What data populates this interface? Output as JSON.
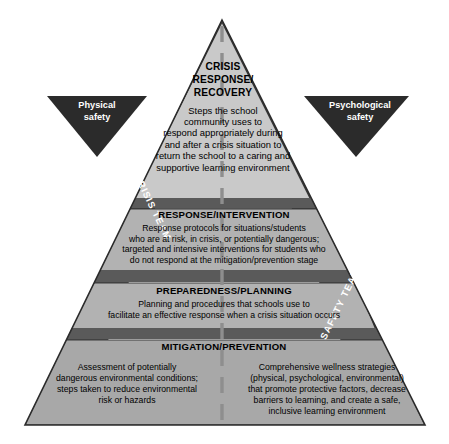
{
  "diagram": {
    "type": "pyramid",
    "colors": {
      "tier_face": "#a8a8a8",
      "tier_face_light": "#c9c9c9",
      "tier_divider": "#5a5a5a",
      "left_shadow_face": "#4a4a4a",
      "right_shadow_face": "#4a4a4a",
      "flag_fill": "#2b2b2b",
      "center_dash": "#8e8e8e",
      "outline": "#2b2b2b",
      "text": "#000000",
      "label_text": "#ffffff"
    },
    "center_divider": "dashed-vertical-line"
  },
  "tiers": [
    {
      "id": "crisis-response-recovery",
      "level": 1,
      "title": "CRISIS\nRESPONSE/\nRECOVERY",
      "title_lines": [
        "CRISIS",
        "RESPONSE/",
        "RECOVERY"
      ],
      "body": "Steps the school community uses to respond appropriately during and after a crisis situation to return the school to a caring and supportive learning environment",
      "body_lines": [
        "Steps the school",
        "community uses to",
        "respond appropriately during",
        "and after a crisis situation to",
        "return the school to a caring and",
        "supportive learning environment"
      ]
    },
    {
      "id": "response-intervention",
      "level": 2,
      "title": "RESPONSE/INTERVENTION",
      "body": "Response protocols for situations/students who are at risk, in crisis, or potentially dangerous; targeted and intensive interventions for students who do not respond at the mitigation/prevention stage",
      "body_lines": [
        "Response protocols for situations/students",
        "who are at risk, in crisis, or potentially dangerous;",
        "targeted and intensive interventions for students who",
        "do not respond at the mitigation/prevention stage"
      ]
    },
    {
      "id": "preparedness-planning",
      "level": 3,
      "title": "PREPAREDNESS/PLANNING",
      "body": "Planning and procedures that schools use to facilitate an effective response when a crisis situation occurs",
      "body_lines": [
        "Planning and procedures that schools use to",
        "facilitate an effective response when a crisis situation occurs"
      ]
    },
    {
      "id": "mitigation-prevention",
      "level": 4,
      "title": "MITIGATION/PREVENTION",
      "left_column": "Assessment of potentially dangerous environmental conditions; steps taken to reduce environmental risk or hazards",
      "left_column_lines": [
        "Assessment of potentially",
        "dangerous environmental conditions;",
        "steps taken to reduce environmental",
        "risk or hazards"
      ],
      "right_column": "Comprehensive wellness strategies (physical, psychological, environmental) that promote protective factors, decrease barriers to learning, and create a safe, inclusive learning environment",
      "right_column_lines": [
        "Comprehensive wellness strategies",
        "(physical, psychological, environmental)",
        "that promote protective factors, decrease",
        "barriers to learning, and create a safe,",
        "inclusive learning environment"
      ]
    }
  ],
  "flags": {
    "left": {
      "id": "physical-safety",
      "line1": "Physical",
      "line2": "safety",
      "label": "Physical safety",
      "shape": "down-triangle"
    },
    "right": {
      "id": "psychological-safety",
      "line1": "Psychological",
      "line2": "safety",
      "label": "Psychological safety",
      "shape": "down-triangle"
    }
  },
  "edge_labels": {
    "left": {
      "id": "crisis-team",
      "text": "CRISIS TEAM",
      "orientation": "along-left-diagonal"
    },
    "right": {
      "id": "safety-team",
      "text": "SAFETY TEAM",
      "orientation": "along-right-diagonal"
    }
  }
}
